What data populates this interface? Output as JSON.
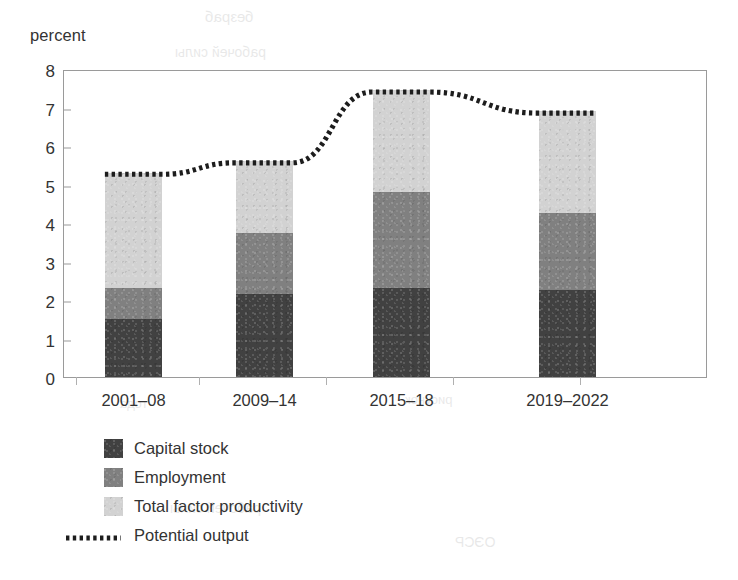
{
  "chart_data": {
    "type": "bar",
    "subtype": "stacked-bar-with-line-overlay",
    "title": "",
    "ylabel": "percent",
    "xlabel": "",
    "ylim": [
      0,
      8
    ],
    "yticks": [
      0,
      1,
      2,
      3,
      4,
      5,
      6,
      7,
      8
    ],
    "ytick_labels": [
      "0",
      "1",
      "2",
      "3",
      "4",
      "5",
      "6",
      "7",
      "8"
    ],
    "grid": false,
    "legend_position": "below-axis-left",
    "categories": [
      "2001–08",
      "2009–14",
      "2015–18",
      "2019–2022"
    ],
    "series": [
      {
        "name": "Capital stock",
        "color": "#414141",
        "values": [
          1.5,
          2.15,
          2.3,
          2.25
        ]
      },
      {
        "name": "Employment",
        "color": "#808080",
        "values": [
          0.8,
          1.6,
          2.5,
          2.0
        ]
      },
      {
        "name": "Total factor productivity",
        "color": "#d2d2d2",
        "values": [
          3.0,
          1.85,
          2.65,
          2.65
        ]
      }
    ],
    "stack_totals": [
      5.3,
      5.6,
      7.45,
      6.9
    ],
    "overlay_line": {
      "name": "Potential output",
      "style": "dotted",
      "color": "#1d1d1d",
      "values": [
        5.3,
        5.6,
        7.45,
        6.9
      ]
    }
  },
  "axis": {
    "y_title": "percent"
  },
  "legend": {
    "items": [
      {
        "label": "Capital stock",
        "swatch": "square",
        "color": "#414141"
      },
      {
        "label": "Employment",
        "swatch": "square",
        "color": "#808080"
      },
      {
        "label": "Total factor productivity",
        "swatch": "square",
        "color": "#d2d2d2"
      },
      {
        "label": "Potential output",
        "swatch": "dotted-line",
        "color": "#1d1d1d"
      }
    ]
  },
  "ghost_text": [
    {
      "text": "безраб",
      "x": 205,
      "y": 8,
      "size": 15
    },
    {
      "text": "рабочей силы",
      "x": 175,
      "y": 44,
      "size": 14
    },
    {
      "text": "года",
      "x": 120,
      "y": 396,
      "size": 13
    },
    {
      "text": "рисунок",
      "x": 405,
      "y": 392,
      "size": 13
    },
    {
      "text": "рабочей силы",
      "x": 170,
      "y": 500,
      "size": 14
    },
    {
      "text": "ОЭСР",
      "x": 455,
      "y": 534,
      "size": 14
    }
  ]
}
